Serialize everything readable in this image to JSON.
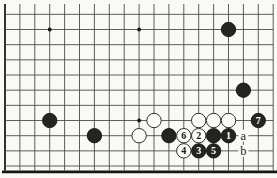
{
  "diagram": {
    "kind": "go-board-diagram",
    "board_size": 19,
    "visible_columns": {
      "from": 0,
      "to": 18
    },
    "visible_rows": {
      "from": 8,
      "to": 18,
      "top_cropped": true
    },
    "colors": {
      "paper": "#faf9f6",
      "grid_line": "#4c4c4c",
      "board_edge": "#1b1b1b",
      "frame": "#161616",
      "black_stone": "#242422",
      "black_stone_rim": "#0d0d0d",
      "white_stone": "#fcfbf9",
      "white_stone_rim": "#2e2e2e",
      "number_on_black": "#ffffff",
      "number_on_white": "#141414",
      "label_text": "#1a1a1a",
      "star_point": "#111111"
    },
    "star_points": [
      {
        "col": 3,
        "row": 9
      },
      {
        "col": 9,
        "row": 9
      },
      {
        "col": 9,
        "row": 15
      }
    ],
    "setup_stones": [
      {
        "color": "black",
        "col": 15,
        "row": 9
      },
      {
        "color": "black",
        "col": 16,
        "row": 13
      },
      {
        "color": "black",
        "col": 3,
        "row": 15
      },
      {
        "color": "black",
        "col": 6,
        "row": 16
      },
      {
        "color": "black",
        "col": 11,
        "row": 16
      },
      {
        "color": "black",
        "col": 14,
        "row": 16
      },
      {
        "color": "white",
        "col": 10,
        "row": 15
      },
      {
        "color": "white",
        "col": 13,
        "row": 15
      },
      {
        "color": "white",
        "col": 14,
        "row": 15
      },
      {
        "color": "white",
        "col": 15,
        "row": 15
      },
      {
        "color": "white",
        "col": 9,
        "row": 16
      }
    ],
    "moves": [
      {
        "n": "1",
        "color": "black",
        "col": 15,
        "row": 16
      },
      {
        "n": "2",
        "color": "white",
        "col": 13,
        "row": 16
      },
      {
        "n": "3",
        "color": "black",
        "col": 13,
        "row": 17
      },
      {
        "n": "4",
        "color": "white",
        "col": 12,
        "row": 17
      },
      {
        "n": "5",
        "color": "black",
        "col": 14,
        "row": 17
      },
      {
        "n": "6",
        "color": "white",
        "col": 12,
        "row": 16
      },
      {
        "n": "7",
        "color": "black",
        "col": 17,
        "row": 15
      }
    ],
    "labels": [
      {
        "text": "a",
        "col": 16,
        "row": 16
      },
      {
        "text": "b",
        "col": 16,
        "row": 17
      }
    ]
  }
}
